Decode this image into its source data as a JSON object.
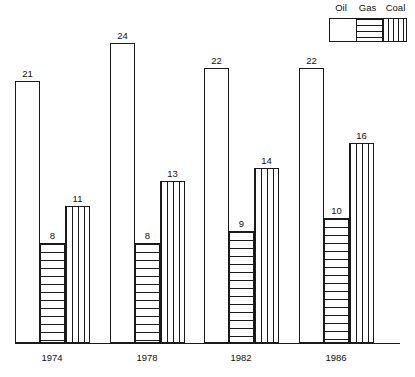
{
  "legend": {
    "items": [
      {
        "label": "Oil",
        "pattern": "blank"
      },
      {
        "label": "Gas",
        "pattern": "hlines"
      },
      {
        "label": "Coal",
        "pattern": "vlines"
      }
    ]
  },
  "chart_data": {
    "type": "bar",
    "title": "",
    "xlabel": "",
    "ylabel": "",
    "ylim": [
      0,
      24
    ],
    "grid": false,
    "legend_position": "top-right",
    "categories": [
      "1974",
      "1978",
      "1982",
      "1986"
    ],
    "series": [
      {
        "name": "Oil",
        "pattern": "blank",
        "values": [
          21,
          24,
          22,
          22
        ]
      },
      {
        "name": "Gas",
        "pattern": "hlines",
        "values": [
          8,
          8,
          9,
          10
        ]
      },
      {
        "name": "Coal",
        "pattern": "vlines",
        "values": [
          11,
          13,
          14,
          16
        ]
      }
    ],
    "value_labels": [
      [
        "21",
        "8",
        "11"
      ],
      [
        "24",
        "8",
        "13"
      ],
      [
        "22",
        "9",
        "14"
      ],
      [
        "22",
        "10",
        "16"
      ]
    ]
  },
  "geometry": {
    "baseline_y": 343,
    "px_per_unit": 12.48,
    "bar_width": 25,
    "group_left_x": [
      15,
      110,
      204,
      299
    ],
    "year_label_center_x": [
      52,
      147,
      241,
      336
    ]
  }
}
